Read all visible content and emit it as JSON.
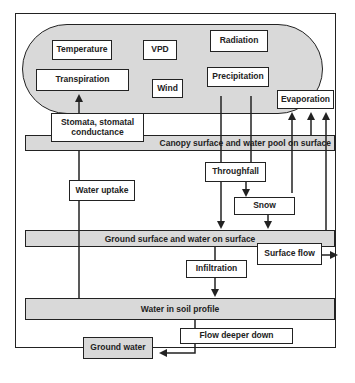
{
  "diagram": {
    "atmosphere_factors": {
      "temperature": "Temperature",
      "vpd": "VPD",
      "radiation": "Radiation",
      "transpiration": "Transpiration",
      "wind": "Wind",
      "precipitation": "Precipitation",
      "evaporation": "Evaporation"
    },
    "stomata": "Stomata, stomatal conductance",
    "layers": {
      "canopy": "Canopy surface and water pool on surface",
      "ground": "Ground surface and water on surface",
      "soil": "Water in soil profile"
    },
    "processes": {
      "water_uptake": "Water uptake",
      "throughfall": "Throughfall",
      "snow": "Snow",
      "surface_flow": "Surface flow",
      "infiltration": "Infiltration",
      "flow_deeper": "Flow deeper down",
      "ground_water": "Ground water"
    },
    "colors": {
      "fill": "#d9d9d9",
      "line": "#222222",
      "box": "#ffffff"
    }
  }
}
